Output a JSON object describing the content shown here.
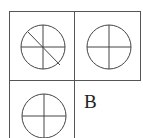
{
  "grid": {
    "cells": [
      {
        "id": "top-left",
        "figure": "circle-quartered-with-diagonal"
      },
      {
        "id": "top-right",
        "figure": "circle-quartered"
      },
      {
        "id": "bottom-left",
        "figure": "circle-quartered"
      },
      {
        "id": "bottom-right",
        "figure": "empty"
      }
    ],
    "answer_label": "B"
  }
}
